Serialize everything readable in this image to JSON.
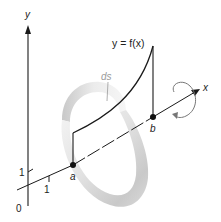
{
  "figure": {
    "axes": {
      "y_label": "y",
      "x_label": "x",
      "origin_label": "0",
      "y_tick_label": "1",
      "x_tick_label": "1"
    },
    "curve": {
      "equation_label": "y = f(x)",
      "arc_element_label": "ds"
    },
    "points": {
      "a_label": "a",
      "b_label": "b"
    },
    "colors": {
      "line": "#1a1a1a",
      "band_light": "#f0f0f0",
      "band_dark": "#c4c4c4",
      "ds_label": "#9a9a9a",
      "rotation_arrow": "#777777"
    }
  }
}
